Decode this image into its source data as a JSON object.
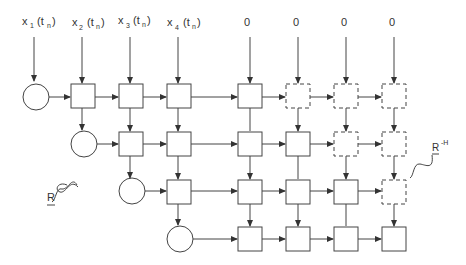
{
  "inputs": {
    "x1": {
      "base": "x",
      "sub": "1",
      "arg": "(t",
      "argsub": "n",
      "close": ")"
    },
    "x2": {
      "base": "x",
      "sub": "2",
      "arg": "(t",
      "argsub": "n",
      "close": ")"
    },
    "x3": {
      "base": "x",
      "sub": "3",
      "arg": "(t",
      "argsub": "n",
      "close": ")"
    },
    "x4": {
      "base": "x",
      "sub": "4",
      "arg": "(t",
      "argsub": "n",
      "close": ")"
    },
    "zeros": [
      "0",
      "0",
      "0",
      "0"
    ]
  },
  "labels": {
    "r": "R",
    "r_inv_h": "R",
    "r_inv_h_sup": "-H"
  },
  "colors": {
    "stroke": "#444444",
    "background": "#ffffff"
  }
}
